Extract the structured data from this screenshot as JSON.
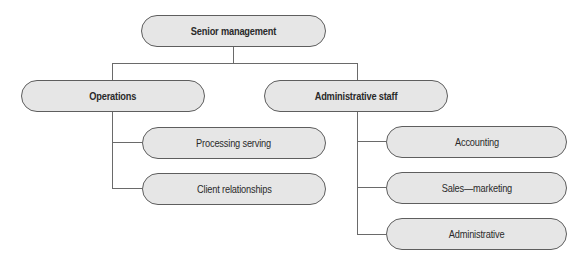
{
  "org_chart": {
    "root": {
      "label": "Senior management"
    },
    "branches": [
      {
        "label": "Operations",
        "children": [
          {
            "label": "Processing serving"
          },
          {
            "label": "Client relationships"
          }
        ]
      },
      {
        "label": "Administrative staff",
        "children": [
          {
            "label": "Accounting"
          },
          {
            "label": "Sales—marketing"
          },
          {
            "label": "Administrative"
          }
        ]
      }
    ]
  },
  "colors": {
    "node_fill": "#e6e6e6",
    "node_border": "#5e5e5e",
    "connector": "#6a6a6a"
  }
}
